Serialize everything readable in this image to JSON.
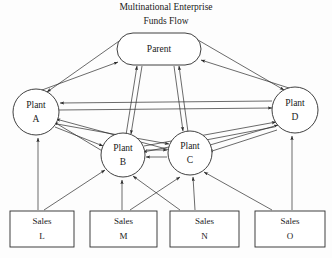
{
  "figure": {
    "title_line1": "Multinational Enterprise",
    "title_line2": "Funds Flow",
    "background_color": "#fdfdfd",
    "stroke_color": "#2b2b2b",
    "fill_color": "#ffffff"
  },
  "nodes": {
    "parent": {
      "label": "Parent",
      "shape": "stadium",
      "cx": 159,
      "cy": 49,
      "w": 84,
      "h": 32
    },
    "plant_a": {
      "label_line1": "Plant",
      "label_line2": "A",
      "shape": "circle",
      "cx": 36,
      "cy": 112,
      "r": 23
    },
    "plant_b": {
      "label_line1": "Plant",
      "label_line2": "B",
      "shape": "circle",
      "cx": 123,
      "cy": 155,
      "r": 22
    },
    "plant_c": {
      "label_line1": "Plant",
      "label_line2": "C",
      "shape": "circle",
      "cx": 190,
      "cy": 153,
      "r": 22
    },
    "plant_d": {
      "label_line1": "Plant",
      "label_line2": "D",
      "shape": "circle",
      "cx": 295,
      "cy": 110,
      "r": 23
    },
    "sales_l": {
      "label_line1": "Sales",
      "label_line2": "L",
      "shape": "rect",
      "x": 10,
      "y": 211,
      "w": 64,
      "h": 36
    },
    "sales_m": {
      "label_line1": "Sales",
      "label_line2": "M",
      "shape": "rect",
      "x": 90,
      "y": 211,
      "w": 67,
      "h": 36
    },
    "sales_n": {
      "label_line1": "Sales",
      "label_line2": "N",
      "shape": "rect",
      "x": 170,
      "y": 211,
      "w": 69,
      "h": 36
    },
    "sales_o": {
      "label_line1": "Sales",
      "label_line2": "O",
      "shape": "rect",
      "x": 255,
      "y": 211,
      "w": 70,
      "h": 36
    }
  },
  "edges": [
    {
      "from": "parent",
      "to": "plant_a",
      "direction": "bidirectional",
      "style": "double-line"
    },
    {
      "from": "parent",
      "to": "plant_b",
      "direction": "bidirectional",
      "style": "double-line"
    },
    {
      "from": "parent",
      "to": "plant_c",
      "direction": "bidirectional",
      "style": "double-line"
    },
    {
      "from": "parent",
      "to": "plant_d",
      "direction": "bidirectional",
      "style": "double-line"
    },
    {
      "from": "plant_a",
      "to": "plant_d",
      "direction": "bidirectional",
      "style": "double-line"
    },
    {
      "from": "plant_a",
      "to": "plant_b",
      "direction": "bidirectional",
      "style": "double-line"
    },
    {
      "from": "plant_a",
      "to": "plant_c",
      "direction": "bidirectional",
      "style": "double-line"
    },
    {
      "from": "plant_b",
      "to": "plant_c",
      "direction": "bidirectional",
      "style": "double-line"
    },
    {
      "from": "plant_b",
      "to": "plant_d",
      "direction": "bidirectional",
      "style": "double-line"
    },
    {
      "from": "plant_c",
      "to": "plant_d",
      "direction": "bidirectional",
      "style": "double-line"
    },
    {
      "from": "sales_l",
      "to": "plant_a",
      "direction": "one-way",
      "style": "single-line"
    },
    {
      "from": "sales_l",
      "to": "plant_b",
      "direction": "one-way",
      "style": "single-line"
    },
    {
      "from": "sales_m",
      "to": "plant_b",
      "direction": "one-way",
      "style": "single-line"
    },
    {
      "from": "sales_m",
      "to": "plant_c",
      "direction": "one-way",
      "style": "single-line"
    },
    {
      "from": "sales_n",
      "to": "plant_b",
      "direction": "one-way",
      "style": "single-line"
    },
    {
      "from": "sales_n",
      "to": "plant_c",
      "direction": "one-way",
      "style": "single-line"
    },
    {
      "from": "sales_o",
      "to": "plant_c",
      "direction": "one-way",
      "style": "single-line"
    },
    {
      "from": "sales_o",
      "to": "plant_d",
      "direction": "one-way",
      "style": "single-line"
    }
  ]
}
